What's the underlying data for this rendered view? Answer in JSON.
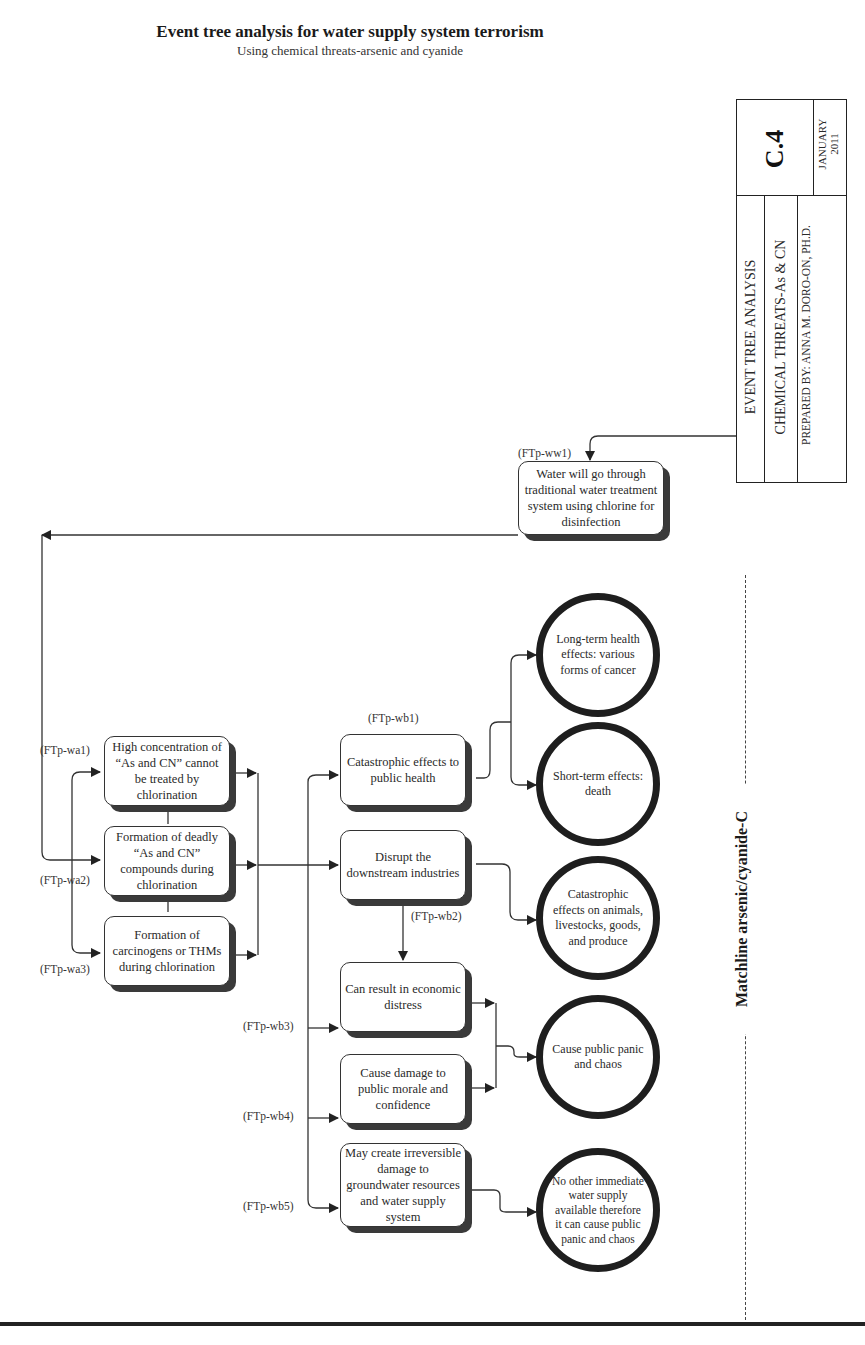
{
  "header": {
    "title": "Event tree analysis for water supply system terrorism",
    "subtitle": "Using chemical threats-arsenic and cyanide"
  },
  "title_block": {
    "sheet_number": "C.4",
    "date_month": "JANUARY",
    "date_year": "2011",
    "row1": "EVENT TREE ANALYSIS",
    "row2": "CHEMICAL THREATS-As & CN",
    "row3": "PREPARED BY: ANNA M. DORO-ON, PH.D."
  },
  "matchline": "Matchline arsenic/cyanide-C",
  "nodes": {
    "ww1": {
      "code": "(FTp-ww1)",
      "text": "Water will go through traditional water treatment system using chlorine for disinfection"
    },
    "wa1": {
      "code": "(FTp-wa1)",
      "text": "High concentration of “As and CN” cannot be treated by chlorination"
    },
    "wa2": {
      "code": "(FTp-wa2)",
      "text": "Formation of deadly “As and CN” compounds during chlorination"
    },
    "wa3": {
      "code": "(FTp-wa3)",
      "text": "Formation of carcinogens or THMs during chlorination"
    },
    "wb1": {
      "code": "(FTp-wb1)",
      "text": "Catastrophic effects to public health"
    },
    "wb_disrupt": {
      "text": "Disrupt the downstream industries"
    },
    "wb2": {
      "code": "(FTp-wb2)"
    },
    "wb3": {
      "code": "(FTp-wb3)",
      "text": "Can result in economic distress"
    },
    "wb4": {
      "code": "(FTp-wb4)",
      "text": "Cause damage to public morale and confidence"
    },
    "wb5": {
      "code": "(FTp-wb5)",
      "text": "May create irreversible damage to groundwater resources and water supply system"
    }
  },
  "outcomes": [
    {
      "text": "Long-term health effects: various forms of cancer"
    },
    {
      "text": "Short-term effects: death"
    },
    {
      "text": "Catastrophic effects on animals, livestocks, goods, and produce"
    },
    {
      "text": "Cause public panic and chaos"
    },
    {
      "text": "No other immediate water supply available therefore it can cause public panic and chaos"
    }
  ]
}
